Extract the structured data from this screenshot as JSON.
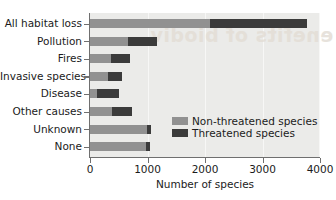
{
  "chart_data": {
    "type": "bar",
    "orientation": "horizontal",
    "stacked": true,
    "title": "",
    "xlabel": "Number of species",
    "ylabel": "",
    "xlim": [
      0,
      4000
    ],
    "xticks": [
      0,
      1000,
      2000,
      3000,
      4000
    ],
    "xticklabels": [
      "0",
      "1000",
      "2000",
      "3000",
      "4000"
    ],
    "grid": "vertical",
    "legend_position": "lower-right-inside",
    "categories": [
      "All habitat loss",
      "Pollution",
      "Fires",
      "Invasive species",
      "Disease",
      "Other causes",
      "Unknown",
      "None"
    ],
    "series": [
      {
        "name": "Non-threatened species",
        "color": "#919191",
        "values": [
          2090,
          655,
          370,
          320,
          130,
          380,
          985,
          980
        ]
      },
      {
        "name": "Threatened species",
        "color": "#3b3b3b",
        "values": [
          1685,
          505,
          330,
          235,
          375,
          355,
          80,
          60
        ]
      }
    ],
    "totals": [
      3775,
      1160,
      700,
      555,
      505,
      735,
      1065,
      1040
    ]
  },
  "legend": {
    "items": [
      {
        "label": "Non-threatened species",
        "color": "#919191"
      },
      {
        "label": "Threatened species",
        "color": "#3b3b3b"
      }
    ]
  },
  "watermark": {
    "text": "enefits of biodiv"
  }
}
